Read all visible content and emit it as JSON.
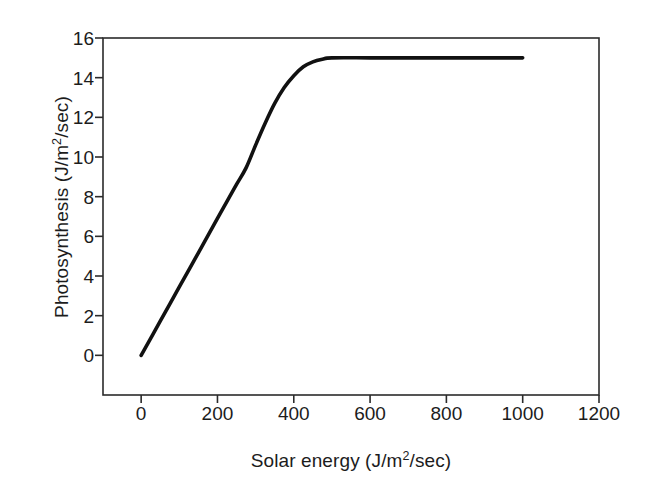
{
  "figure": {
    "background_color": "#ffffff",
    "frame_color": "#2b2b2b",
    "series_color": "#111111"
  },
  "axes": {
    "x_title_plain": "Solar energy (J/m2/sec)",
    "x_title_pre": "Solar energy (J/m",
    "x_title_sup": "2",
    "x_title_post": "/sec)",
    "y_title_plain": "Photosynthesis (J/m2/sec)",
    "y_title_pre": "Photosynthesis (J/m",
    "y_title_sup": "2",
    "y_title_post": "/sec)",
    "x_ticks": [
      "0",
      "200",
      "400",
      "600",
      "800",
      "1000",
      "1200"
    ],
    "y_ticks": [
      "0",
      "2",
      "4",
      "6",
      "8",
      "10",
      "12",
      "14",
      "16"
    ]
  },
  "chart_data": {
    "type": "line",
    "title": "",
    "subtitle": "",
    "xlabel": "Solar energy (J/m2/sec)",
    "ylabel": "Photosynthesis (J/m2/sec)",
    "xlim": [
      -100,
      1200
    ],
    "ylim": [
      -2,
      16
    ],
    "xticks": [
      0,
      200,
      400,
      600,
      800,
      1000,
      1200
    ],
    "yticks": [
      0,
      2,
      4,
      6,
      8,
      10,
      12,
      14,
      16
    ],
    "grid": false,
    "legend": null,
    "annotations": [],
    "series": [
      {
        "name": "Photosynthesis light response",
        "color": "#111111",
        "line_width": 3.6,
        "x": [
          0,
          50,
          100,
          150,
          200,
          225,
          250,
          275,
          300,
          325,
          350,
          375,
          400,
          425,
          450,
          475,
          500,
          600,
          700,
          800,
          900,
          1000
        ],
        "y": [
          0,
          1.72,
          3.45,
          5.17,
          6.9,
          7.76,
          8.62,
          9.45,
          10.6,
          11.7,
          12.7,
          13.5,
          14.1,
          14.55,
          14.8,
          14.93,
          15.0,
          15.0,
          15.0,
          15.0,
          15.0,
          15.0
        ]
      }
    ],
    "saturation_value": 15.0,
    "saturation_onset_x": 500,
    "initial_slope_per_unit": 0.0345
  }
}
